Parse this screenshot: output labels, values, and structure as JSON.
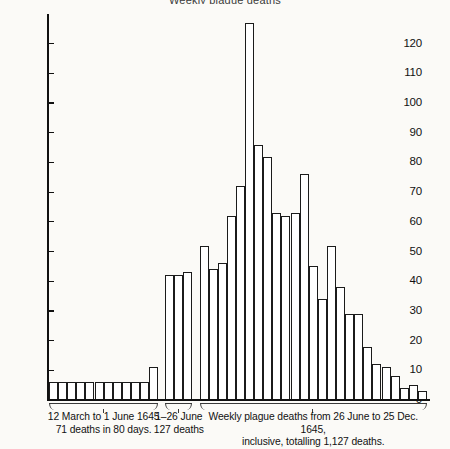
{
  "figure": {
    "title": "Weekly plague deaths",
    "source_note": ""
  },
  "axis": {
    "y_ticks": [
      0,
      10,
      20,
      30,
      40,
      50,
      60,
      70,
      80,
      90,
      100,
      110,
      120
    ],
    "y_min": 0,
    "y_max": 130
  },
  "groups": [
    {
      "id": "group-1",
      "caption_line1": "12 March to 1 June 1645",
      "caption_line2": "71 deaths in 80 days.",
      "values": [
        6,
        6,
        6,
        6,
        6,
        6,
        6,
        6,
        6,
        6,
        6,
        11
      ]
    },
    {
      "id": "group-2",
      "caption_line1": "1–26 June",
      "caption_line2": "127 deaths",
      "values": [
        42,
        42,
        43
      ]
    },
    {
      "id": "group-3",
      "caption_line1": "Weekly plague deaths from 26 June to 25 Dec. 1645,",
      "caption_line2": "inclusive, totalling 1,127 deaths.",
      "values": [
        52,
        44,
        46,
        62,
        72,
        127,
        86,
        82,
        63,
        62,
        63,
        76,
        45,
        34,
        52,
        38,
        29,
        29,
        18,
        12,
        11,
        8,
        4,
        5,
        3
      ]
    }
  ],
  "chart_data": {
    "type": "bar",
    "title": "Weekly plague deaths",
    "xlabel": "",
    "ylabel": "",
    "ylim": [
      0,
      130
    ],
    "yticks": [
      0,
      10,
      20,
      30,
      40,
      50,
      60,
      70,
      80,
      90,
      100,
      110,
      120
    ],
    "grid": false,
    "legend": "none",
    "series": [
      {
        "name": "Plague deaths per period",
        "values": [
          6,
          6,
          6,
          6,
          6,
          6,
          6,
          6,
          6,
          6,
          6,
          11,
          42,
          42,
          43,
          52,
          44,
          46,
          62,
          72,
          127,
          86,
          82,
          63,
          62,
          63,
          76,
          45,
          34,
          52,
          38,
          29,
          29,
          18,
          12,
          11,
          8,
          4,
          5,
          3
        ]
      }
    ],
    "segments": [
      {
        "label": "12 March to 1 June 1645, 71 deaths in 80 days.",
        "n_bars": 12,
        "values": [
          6,
          6,
          6,
          6,
          6,
          6,
          6,
          6,
          6,
          6,
          6,
          11
        ]
      },
      {
        "label": "1–26 June, 127 deaths",
        "n_bars": 3,
        "values": [
          42,
          42,
          43
        ]
      },
      {
        "label": "Weekly plague deaths from 26 June to 25 Dec. 1645, inclusive, totalling 1,127 deaths.",
        "n_bars": 25,
        "values": [
          52,
          44,
          46,
          62,
          72,
          127,
          86,
          82,
          63,
          62,
          63,
          76,
          45,
          34,
          52,
          38,
          29,
          29,
          18,
          12,
          11,
          8,
          4,
          5,
          3
        ]
      }
    ],
    "annotations": [
      "12 March to 1 June 1645 71 deaths in 80 days.",
      "1–26 June 127 deaths",
      "Weekly plague deaths from 26 June to 25 Dec. 1645, inclusive, totalling 1,127 deaths."
    ]
  }
}
